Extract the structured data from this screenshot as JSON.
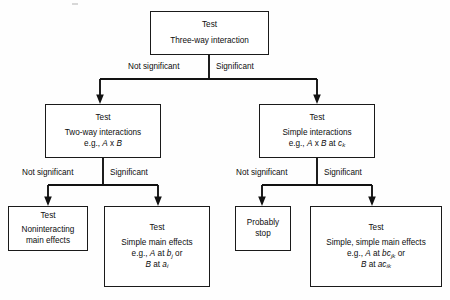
{
  "figure": {
    "type": "flowchart",
    "line_color": "#121212",
    "box_fill": "#ffffff",
    "text_color": "#0d0d0d"
  },
  "nodes": {
    "root": {
      "head": "Test",
      "line1": "Three-way interaction"
    },
    "two_way": {
      "head": "Test",
      "line1": "Two-way interactions",
      "line2_pre": "e.g., ",
      "line2_a": "A",
      "line2_mid": " x ",
      "line2_b": "B"
    },
    "simple_interactions": {
      "head": "Test",
      "line1": "Simple interactions",
      "line2_pre": "e.g., ",
      "line2_a": "A",
      "line2_mid": " x ",
      "line2_b": "B",
      "line2_at": " at ",
      "line2_term": "c",
      "line2_sub": "k"
    },
    "noninteracting": {
      "head": "Test",
      "line1": "Noninteracting",
      "line2": "main effects"
    },
    "simple_main": {
      "head": "Test",
      "line1": "Simple main effects",
      "line2_pre": "e.g., ",
      "line2_a": "A",
      "line2_at": " at ",
      "line2_term": "b",
      "line2_sub": "j",
      "line2_or": " or",
      "line3_a": "B",
      "line3_at": " at ",
      "line3_term": "a",
      "line3_sub": "i"
    },
    "probably_stop": {
      "line1": "Probably",
      "line2": "stop"
    },
    "simple_simple_main": {
      "head": "Test",
      "line1": "Simple, simple main effects",
      "line2_pre": "e.g., ",
      "line2_a": "A",
      "line2_at": " at ",
      "line2_term": "bc",
      "line2_sub": "jk",
      "line2_or": " or",
      "line3_a": "B",
      "line3_at": " at ",
      "line3_term": "ac",
      "line3_sub": "ik"
    }
  },
  "edges": {
    "root_left": "Not significant",
    "root_right": "Significant",
    "two_way_left": "Not significant",
    "two_way_right": "Significant",
    "simple_left": "Not significant",
    "simple_right": "Significant"
  }
}
